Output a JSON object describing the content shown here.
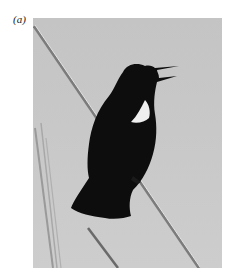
{
  "figure": {
    "panel_label": "(a)",
    "photo_subject": "red-winged blackbird singing on reed",
    "colors": {
      "background": "#c9c9c9",
      "bird": "#0d0d0d",
      "wing_patch": "#f0f0f0",
      "reed": "#8a8a8a"
    }
  }
}
